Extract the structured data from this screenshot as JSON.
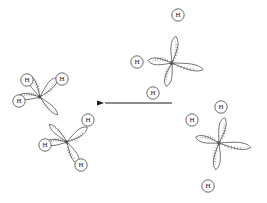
{
  "page": {
    "width": 267,
    "height": 203,
    "background": "#ffffff",
    "header_text": "",
    "ink_color": "#2a2a2a",
    "label_color": "#1a1a1a"
  },
  "diagram": {
    "type": "chemical-orbital-diagram",
    "reaction_direction": "right-to-left",
    "arrow": {
      "name": "reaction-arrow",
      "x_start": 172,
      "x_end": 104,
      "y": 103,
      "points": "left",
      "color": "#1a1a1a"
    },
    "molecules": [
      {
        "id": "ethane-product",
        "name": "ethane-molecule",
        "position": "left",
        "centers": [
          {
            "id": "carbon-upper",
            "label": "C",
            "x": 40,
            "y": 97,
            "lobes": [
              {
                "id": "lobe-upper-left",
                "angle": -118,
                "length": 25,
                "width": 11,
                "terminal": "H"
              },
              {
                "id": "lobe-upper-right",
                "angle": -48,
                "length": 26,
                "width": 11,
                "terminal": "H"
              },
              {
                "id": "lobe-left",
                "angle": 182,
                "length": 22,
                "width": 10,
                "terminal": "H"
              },
              {
                "id": "lobe-bond",
                "angle": 45,
                "length": 25,
                "width": 8,
                "terminal": null
              }
            ]
          },
          {
            "id": "carbon-lower",
            "label": "C",
            "x": 67,
            "y": 142,
            "lobes": [
              {
                "id": "lobe-bond",
                "angle": -135,
                "length": 25,
                "width": 8,
                "terminal": null
              },
              {
                "id": "lobe-upper-right",
                "angle": -36,
                "length": 25,
                "width": 11,
                "terminal": "H"
              },
              {
                "id": "lobe-left",
                "angle": 178,
                "length": 22,
                "width": 10,
                "terminal": "H"
              },
              {
                "id": "lobe-lower-right",
                "angle": 62,
                "length": 25,
                "width": 11,
                "terminal": "H"
              }
            ]
          }
        ],
        "hydrogens": [
          {
            "label": "H",
            "x": 27,
            "y": 80
          },
          {
            "label": "H",
            "x": 62,
            "y": 79
          },
          {
            "label": "H",
            "x": 19,
            "y": 101
          },
          {
            "label": "H",
            "x": 88,
            "y": 120
          },
          {
            "label": "H",
            "x": 45,
            "y": 145
          },
          {
            "label": "H",
            "x": 81,
            "y": 165
          }
        ]
      },
      {
        "id": "methyl-top",
        "name": "methyl-radical-top",
        "position": "top-right",
        "centers": [
          {
            "id": "carbon",
            "label": "C",
            "x": 172,
            "y": 63,
            "lobes": [
              {
                "id": "lobe-up",
                "angle": -82,
                "length": 27,
                "width": 11,
                "terminal": "H"
              },
              {
                "id": "lobe-left",
                "angle": 186,
                "length": 24,
                "width": 11,
                "terminal": "H"
              },
              {
                "id": "lobe-down",
                "angle": 104,
                "length": 24,
                "width": 11,
                "terminal": "H"
              },
              {
                "id": "lobe-right-open",
                "angle": 12,
                "length": 32,
                "width": 10,
                "terminal": null
              }
            ]
          }
        ],
        "hydrogens": [
          {
            "label": "H",
            "x": 178,
            "y": 15
          },
          {
            "label": "H",
            "x": 137,
            "y": 62
          },
          {
            "label": "H",
            "x": 153,
            "y": 93
          }
        ]
      },
      {
        "id": "methyl-bottom",
        "name": "methyl-radical-bottom",
        "position": "bottom-right",
        "centers": [
          {
            "id": "carbon",
            "label": "C",
            "x": 219,
            "y": 143,
            "lobes": [
              {
                "id": "lobe-up",
                "angle": -78,
                "length": 26,
                "width": 11,
                "terminal": "H"
              },
              {
                "id": "lobe-left",
                "angle": 194,
                "length": 24,
                "width": 11,
                "terminal": "H"
              },
              {
                "id": "lobe-down",
                "angle": 97,
                "length": 27,
                "width": 11,
                "terminal": "H"
              },
              {
                "id": "lobe-right-open",
                "angle": 8,
                "length": 32,
                "width": 11,
                "terminal": null
              }
            ]
          }
        ],
        "hydrogens": [
          {
            "label": "H",
            "x": 221,
            "y": 107
          },
          {
            "label": "H",
            "x": 192,
            "y": 120
          },
          {
            "label": "H",
            "x": 208,
            "y": 186
          }
        ]
      }
    ]
  }
}
